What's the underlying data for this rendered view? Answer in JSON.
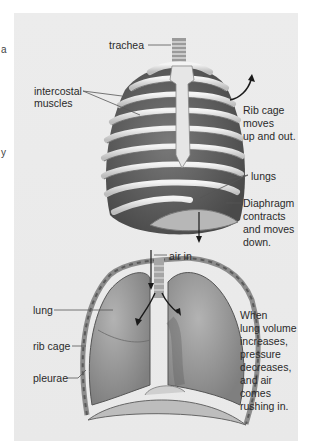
{
  "edge_fragments": [
    "a",
    "y"
  ],
  "diagram": {
    "top_figure": {
      "labels": {
        "trachea": "trachea",
        "intercostal_1": "intercostal",
        "intercostal_2": "muscles",
        "rib_cage_1": "Rib cage",
        "rib_cage_2": "moves",
        "rib_cage_3": "up and out.",
        "lungs": "lungs",
        "diaphragm_1": "Diaphragm",
        "diaphragm_2": "contracts",
        "diaphragm_3": "and moves",
        "diaphragm_4": "down."
      }
    },
    "bottom_figure": {
      "labels": {
        "air_in": "air in",
        "lung": "lung",
        "rib_cage": "rib cage",
        "pleurae": "pleurae"
      },
      "caption": [
        "When",
        "lung volume",
        "increases,",
        "pressure",
        "decreases,",
        "and air",
        "comes",
        "rushing in."
      ]
    },
    "colors": {
      "panel_bg": "#ebebeb",
      "rib": "#e2e2e2",
      "rib_shadow": "#8a8a8a",
      "muscle": "#6e6e6e",
      "lung": "#9c9c9c",
      "text": "#2a2a2a"
    }
  }
}
